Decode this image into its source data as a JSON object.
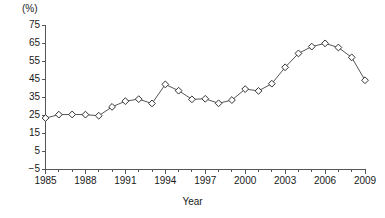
{
  "chart_data": {
    "type": "line",
    "title": "",
    "xlabel": "Year",
    "ylabel": "(%)",
    "unit_label": "(%)",
    "x": [
      1985,
      1986,
      1987,
      1988,
      1989,
      1990,
      1991,
      1992,
      1993,
      1994,
      1995,
      1996,
      1997,
      1998,
      1999,
      2000,
      2001,
      2002,
      2003,
      2004,
      2005,
      2006,
      2007,
      2008,
      2009
    ],
    "values": [
      23.3,
      25.2,
      25.3,
      25.2,
      24.6,
      29.5,
      32.7,
      33.8,
      31.4,
      42.0,
      38.5,
      33.7,
      34.0,
      31.5,
      33.3,
      39.4,
      38.4,
      42.4,
      51.5,
      59.2,
      63.0,
      64.8,
      62.5,
      57.0,
      44.3
    ],
    "categories": [
      "1985",
      "1986",
      "1987",
      "1988",
      "1989",
      "1990",
      "1991",
      "1992",
      "1993",
      "1994",
      "1995",
      "1996",
      "1997",
      "1998",
      "1999",
      "2000",
      "2001",
      "2002",
      "2003",
      "2004",
      "2005",
      "2006",
      "2007",
      "2008",
      "2009"
    ],
    "series": [
      {
        "name": "",
        "values": [
          23.3,
          25.2,
          25.3,
          25.2,
          24.6,
          29.5,
          32.7,
          33.8,
          31.4,
          42.0,
          38.5,
          33.7,
          34.0,
          31.5,
          33.3,
          39.4,
          38.4,
          42.4,
          51.5,
          59.2,
          63.0,
          64.8,
          62.5,
          57.0,
          44.3
        ]
      }
    ],
    "ylim": [
      -5,
      75
    ],
    "xlim": [
      1985,
      2009
    ],
    "yticks": [
      -5,
      5,
      15,
      25,
      35,
      45,
      55,
      65,
      75
    ],
    "ytick_labels": [
      "−5",
      "5",
      "15",
      "25",
      "35",
      "45",
      "55",
      "65",
      "75"
    ],
    "xticks": [
      1985,
      1988,
      1991,
      1994,
      1997,
      2000,
      2003,
      2006,
      2009
    ],
    "xtick_labels": [
      "1985",
      "1988",
      "1991",
      "1994",
      "1997",
      "2000",
      "2003",
      "2006",
      "2009"
    ],
    "xtick_minor_step": 1,
    "grid": false,
    "legend": "none",
    "marker": "diamond-open",
    "line_color": "#555555",
    "marker_fill": "#ffffff",
    "marker_stroke": "#333333",
    "axis_color": "#555555",
    "background": "#ffffff"
  }
}
